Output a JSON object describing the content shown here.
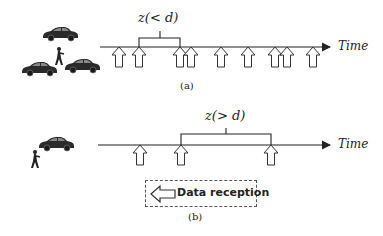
{
  "figure": {
    "panel_a": {
      "caption": "(a)",
      "interval_label": "z(< d)",
      "axis_label": "Time",
      "reception_arrows_x": [
        119,
        139,
        180,
        191,
        221,
        248,
        275,
        287,
        313
      ],
      "bracket": {
        "from_x": 139,
        "to_x": 180
      },
      "actors": [
        "car",
        "car",
        "car",
        "pedestrian"
      ]
    },
    "panel_b": {
      "caption": "(b)",
      "interval_label": "z(> d)",
      "axis_label": "Time",
      "reception_arrows_x": [
        140,
        181,
        271
      ],
      "bracket": {
        "from_x": 181,
        "to_x": 271
      },
      "actors": [
        "car",
        "pedestrian"
      ]
    },
    "legend": {
      "label": "Data reception",
      "icon": "left-hollow-arrow-icon"
    },
    "colors": {
      "line": "#222222",
      "car": "#2a2a2a",
      "background": "#ffffff"
    }
  }
}
